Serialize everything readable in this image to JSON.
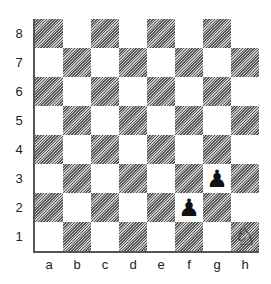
{
  "board": {
    "ranks": [
      "8",
      "7",
      "6",
      "5",
      "4",
      "3",
      "2",
      "1"
    ],
    "files": [
      "a",
      "b",
      "c",
      "d",
      "e",
      "f",
      "g",
      "h"
    ],
    "colors": {
      "light": "#ffffff",
      "dark": "#7a7a7a",
      "piece": "#111111"
    },
    "pieces": [
      {
        "square": "f2",
        "piece": "pawn",
        "color": "black",
        "glyph": "♟"
      },
      {
        "square": "g3",
        "piece": "pawn",
        "color": "black",
        "glyph": "♟"
      },
      {
        "square": "h1",
        "piece": "knight",
        "color": "white",
        "glyph": "♘"
      }
    ]
  }
}
